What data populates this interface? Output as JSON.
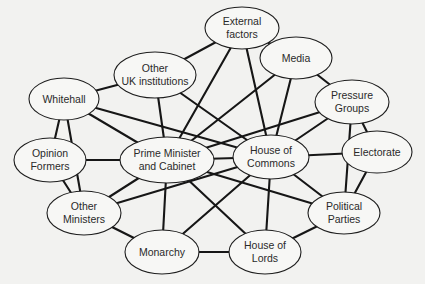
{
  "diagram": {
    "type": "network",
    "nodes": [
      {
        "id": "external",
        "lines": [
          "External",
          "factors"
        ],
        "cx": 242,
        "cy": 28,
        "rx": 37,
        "ry": 21
      },
      {
        "id": "other_uk",
        "lines": [
          "Other",
          "UK institutions"
        ],
        "cx": 155,
        "cy": 75,
        "rx": 41,
        "ry": 23
      },
      {
        "id": "media",
        "lines": [
          "Media"
        ],
        "cx": 296,
        "cy": 58,
        "rx": 36,
        "ry": 21
      },
      {
        "id": "whitehall",
        "lines": [
          "Whitehall"
        ],
        "cx": 64,
        "cy": 99,
        "rx": 35,
        "ry": 21
      },
      {
        "id": "pressure",
        "lines": [
          "Pressure",
          "Groups"
        ],
        "cx": 352,
        "cy": 102,
        "rx": 37,
        "ry": 22
      },
      {
        "id": "opinion",
        "lines": [
          "Opinion",
          "Formers"
        ],
        "cx": 50,
        "cy": 160,
        "rx": 36,
        "ry": 22
      },
      {
        "id": "pm",
        "lines": [
          "Prime Minister",
          "and Cabinet"
        ],
        "cx": 167,
        "cy": 160,
        "rx": 47,
        "ry": 23
      },
      {
        "id": "commons",
        "lines": [
          "House of",
          "Commons"
        ],
        "cx": 271,
        "cy": 157,
        "rx": 38,
        "ry": 22
      },
      {
        "id": "electorate",
        "lines": [
          "Electorate"
        ],
        "cx": 377,
        "cy": 152,
        "rx": 35,
        "ry": 21
      },
      {
        "id": "other_min",
        "lines": [
          "Other",
          "Ministers"
        ],
        "cx": 84,
        "cy": 213,
        "rx": 37,
        "ry": 22
      },
      {
        "id": "parties",
        "lines": [
          "Political",
          "Parties"
        ],
        "cx": 344,
        "cy": 213,
        "rx": 36,
        "ry": 21
      },
      {
        "id": "monarchy",
        "lines": [
          "Monarchy"
        ],
        "cx": 162,
        "cy": 252,
        "rx": 37,
        "ry": 22
      },
      {
        "id": "lords",
        "lines": [
          "House of",
          "Lords"
        ],
        "cx": 265,
        "cy": 252,
        "rx": 36,
        "ry": 22
      }
    ],
    "edges": [
      [
        "external",
        "other_uk"
      ],
      [
        "external",
        "media"
      ],
      [
        "external",
        "pm"
      ],
      [
        "external",
        "commons"
      ],
      [
        "other_uk",
        "whitehall"
      ],
      [
        "other_uk",
        "pm"
      ],
      [
        "other_uk",
        "commons"
      ],
      [
        "media",
        "pressure"
      ],
      [
        "media",
        "pm"
      ],
      [
        "media",
        "commons"
      ],
      [
        "whitehall",
        "opinion"
      ],
      [
        "whitehall",
        "other_min"
      ],
      [
        "whitehall",
        "pm"
      ],
      [
        "whitehall",
        "commons"
      ],
      [
        "pressure",
        "pm"
      ],
      [
        "pressure",
        "commons"
      ],
      [
        "pressure",
        "electorate"
      ],
      [
        "pressure",
        "parties"
      ],
      [
        "opinion",
        "pm"
      ],
      [
        "opinion",
        "other_min"
      ],
      [
        "pm",
        "commons"
      ],
      [
        "pm",
        "other_min"
      ],
      [
        "pm",
        "monarchy"
      ],
      [
        "pm",
        "lords"
      ],
      [
        "pm",
        "parties"
      ],
      [
        "commons",
        "electorate"
      ],
      [
        "commons",
        "parties"
      ],
      [
        "commons",
        "lords"
      ],
      [
        "commons",
        "other_min"
      ],
      [
        "commons",
        "monarchy"
      ],
      [
        "electorate",
        "parties"
      ],
      [
        "other_min",
        "monarchy"
      ],
      [
        "parties",
        "lords"
      ],
      [
        "monarchy",
        "lords"
      ]
    ]
  }
}
